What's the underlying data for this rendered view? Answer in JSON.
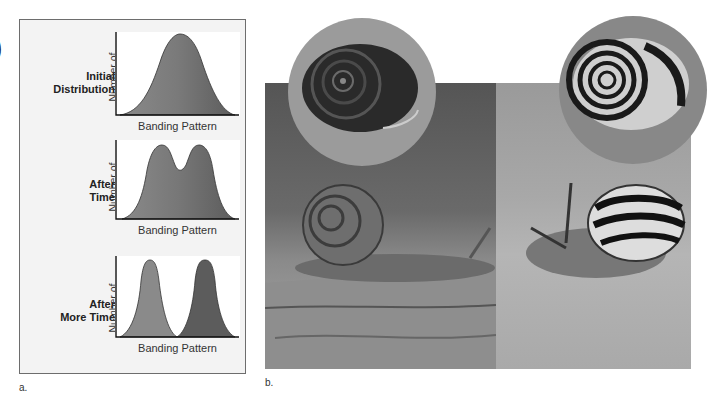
{
  "panel_a": {
    "caption": "a.",
    "rows": [
      {
        "stage": [
          "Initial",
          "Distribution"
        ],
        "ylabel": [
          "Number of",
          "Individuals"
        ],
        "xlabel": "Banding Pattern",
        "shape": "unimodal"
      },
      {
        "stage": [
          "After",
          "Time"
        ],
        "ylabel": [
          "Number of",
          "Individuals"
        ],
        "xlabel": "Banding Pattern",
        "shape": "bimodal-overlapping"
      },
      {
        "stage": [
          "After",
          "More Time"
        ],
        "ylabel": [
          "Number of",
          "Individuals"
        ],
        "xlabel": "Banding Pattern",
        "shape": "bimodal-separated"
      }
    ],
    "colors": {
      "light_fill": "#8a8a8a",
      "dark_fill": "#5c5c5c",
      "plot_bg": "#ffffff",
      "panel_bg": "#f3f3f3",
      "frame": "#6d6d6d"
    }
  },
  "panel_b": {
    "caption": "b.",
    "photos": [
      {
        "subject": "snail with unbanded brown shell on wood",
        "inset": "unbanded shell close-up"
      },
      {
        "subject": "snail with striped banded shell on sand",
        "inset": "banded shell close-up"
      }
    ]
  },
  "edge_glyph": ")"
}
